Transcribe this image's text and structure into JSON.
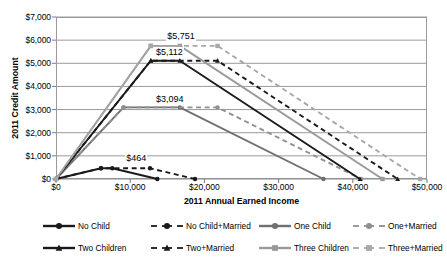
{
  "chart_data": {
    "type": "line",
    "title": "",
    "xlabel": "2011 Annual Earned Income",
    "ylabel": "2011 Credit Amount",
    "xlim": [
      0,
      50000
    ],
    "ylim": [
      0,
      7000
    ],
    "grid": "horizontal",
    "legend_position": "bottom",
    "x_ticks": [
      "$0",
      "$10,000",
      "$20,000",
      "$30,000",
      "$40,000",
      "$50,000"
    ],
    "x_tick_values": [
      0,
      10000,
      20000,
      30000,
      40000,
      50000
    ],
    "y_ticks": [
      "$0",
      "$1,000",
      "$2,000",
      "$3,000",
      "$4,000",
      "$5,000",
      "$6,000",
      "$7,000"
    ],
    "y_tick_values": [
      0,
      1000,
      2000,
      3000,
      4000,
      5000,
      6000,
      7000
    ],
    "annotations": [
      {
        "text": "$5,751",
        "x": 17000,
        "y": 6150
      },
      {
        "text": "$5,112",
        "x": 15500,
        "y": 5450
      },
      {
        "text": "$3,094",
        "x": 15500,
        "y": 3420
      },
      {
        "text": "$464",
        "x": 11500,
        "y": 880
      }
    ],
    "series": [
      {
        "name": "No Child",
        "color": "#1a1a1a",
        "dash": "solid",
        "marker": "circle",
        "peak": 464,
        "points": [
          [
            0,
            0
          ],
          [
            6070,
            464
          ],
          [
            7590,
            464
          ],
          [
            13660,
            0
          ]
        ]
      },
      {
        "name": "No Child+Married",
        "color": "#1a1a1a",
        "dash": "dashed",
        "marker": "circle",
        "peak": 464,
        "points": [
          [
            0,
            0
          ],
          [
            6070,
            464
          ],
          [
            12670,
            464
          ],
          [
            18740,
            0
          ]
        ]
      },
      {
        "name": "One Child",
        "color": "#707070",
        "dash": "solid",
        "marker": "circle",
        "peak": 3094,
        "points": [
          [
            0,
            0
          ],
          [
            9100,
            3094
          ],
          [
            16690,
            3094
          ],
          [
            36052,
            0
          ]
        ]
      },
      {
        "name": "One+Married",
        "color": "#8f8f8f",
        "dash": "dashed",
        "marker": "circle",
        "peak": 3094,
        "points": [
          [
            0,
            0
          ],
          [
            9100,
            3094
          ],
          [
            21770,
            3094
          ],
          [
            41132,
            0
          ]
        ]
      },
      {
        "name": "Two Children",
        "color": "#1a1a1a",
        "dash": "solid",
        "marker": "triangle",
        "peak": 5112,
        "points": [
          [
            0,
            0
          ],
          [
            12780,
            5112
          ],
          [
            16690,
            5112
          ],
          [
            40964,
            0
          ]
        ]
      },
      {
        "name": "Two+Married",
        "color": "#1a1a1a",
        "dash": "dashed",
        "marker": "triangle",
        "peak": 5112,
        "points": [
          [
            0,
            0
          ],
          [
            12780,
            5112
          ],
          [
            21770,
            5112
          ],
          [
            46044,
            0
          ]
        ]
      },
      {
        "name": "Three Children",
        "color": "#9a9a9a",
        "dash": "solid",
        "marker": "square",
        "peak": 5751,
        "points": [
          [
            0,
            0
          ],
          [
            12780,
            5751
          ],
          [
            16690,
            5751
          ],
          [
            43998,
            0
          ]
        ]
      },
      {
        "name": "Three+Married",
        "color": "#a8a8a8",
        "dash": "dashed",
        "marker": "square",
        "peak": 5751,
        "points": [
          [
            0,
            0
          ],
          [
            12780,
            5751
          ],
          [
            21770,
            5751
          ],
          [
            49078,
            0
          ]
        ]
      }
    ]
  },
  "legend": {
    "entries": [
      {
        "label": "No Child"
      },
      {
        "label": "No Child+Married"
      },
      {
        "label": "One Child"
      },
      {
        "label": "One+Married"
      },
      {
        "label": "Two Children"
      },
      {
        "label": "Two+Married"
      },
      {
        "label": "Three Children"
      },
      {
        "label": "Three+Married"
      }
    ]
  }
}
